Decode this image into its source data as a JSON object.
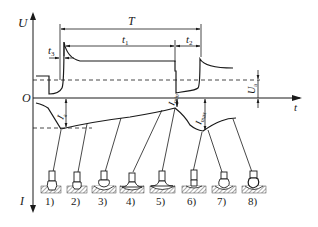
{
  "diagram": {
    "type": "waveform-with-droplet-transfer-stages",
    "colors": {
      "line": "#1a1a1a",
      "background": "#ffffff",
      "hatch": "#555555"
    },
    "axes": {
      "voltage_axis": "U",
      "current_axis": "I",
      "time_axis": "t",
      "origin": "O"
    },
    "dimensions": {
      "period": "T",
      "t1": "t",
      "t1_sub": "1",
      "t2": "t",
      "t2_sub": "2",
      "t3": "t",
      "t3_sub": "3",
      "Ua": "U",
      "Ua_sub": "a",
      "Ia": "I",
      "Ia_sub": "a",
      "Imin": "I",
      "Imin_sub": "min",
      "Imax": "I",
      "Imax_sub": "max"
    },
    "stages": [
      {
        "label": "1)"
      },
      {
        "label": "2)"
      },
      {
        "label": "3)"
      },
      {
        "label": "4)"
      },
      {
        "label": "5)"
      },
      {
        "label": "6)"
      },
      {
        "label": "7)"
      },
      {
        "label": "8)"
      }
    ]
  }
}
